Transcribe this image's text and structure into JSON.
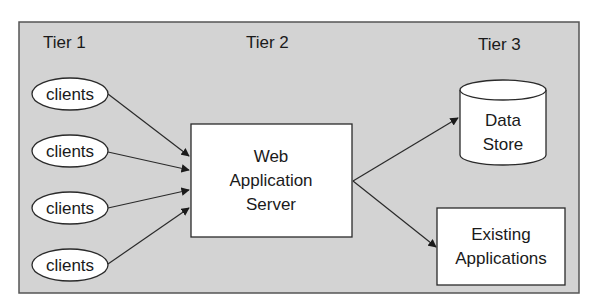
{
  "diagram": {
    "tiers": [
      {
        "label": "Tier 1"
      },
      {
        "label": "Tier 2"
      },
      {
        "label": "Tier 3"
      }
    ],
    "clients": [
      {
        "label": "clients"
      },
      {
        "label": "clients"
      },
      {
        "label": "clients"
      },
      {
        "label": "clients"
      }
    ],
    "server": {
      "lines": [
        "Web",
        "Application",
        "Server"
      ]
    },
    "data_store": {
      "lines": [
        "Data",
        "Store"
      ]
    },
    "existing_apps": {
      "lines": [
        "Existing",
        "Applications"
      ]
    },
    "colors": {
      "panel_bg": "#d3d3d3",
      "panel_border": "#555555",
      "box_fill": "#ffffff",
      "stroke": "#2a2a2a"
    }
  }
}
